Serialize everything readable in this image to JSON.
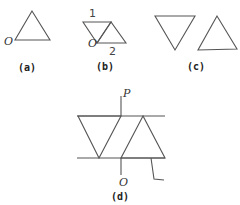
{
  "figures": {
    "a": {
      "caption": "(a)",
      "origin_label": "O"
    },
    "b": {
      "caption": "(b)",
      "origin_label": "O",
      "top_label": "1",
      "bottom_label": "2"
    },
    "c": {
      "caption": "(c)"
    },
    "d": {
      "caption": "(d)",
      "top_label": "P",
      "bottom_label": "O"
    }
  },
  "colors": {
    "line": "#555555",
    "text": "#222222",
    "background": "#ffffff"
  }
}
